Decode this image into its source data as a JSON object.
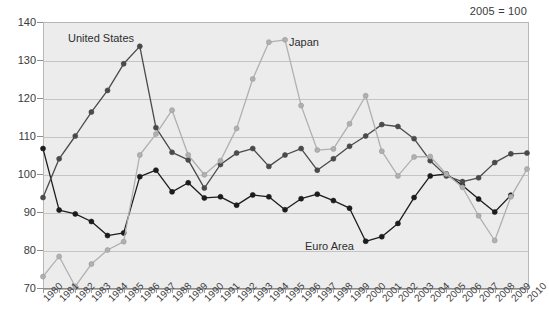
{
  "header": {
    "note": "2005 = 100"
  },
  "annotations": [
    {
      "name": "series-label-united-states",
      "text": "United States",
      "x": 68,
      "y": 32
    },
    {
      "name": "series-label-japan",
      "text": "Japan",
      "x": 289,
      "y": 36
    },
    {
      "name": "series-label-euro-area",
      "text": "Euro Area",
      "x": 305,
      "y": 240
    }
  ],
  "chart_data": {
    "type": "line",
    "title": "",
    "subtitle": "2005 = 100",
    "xlabel": "",
    "ylabel": "",
    "xlim": [
      1980,
      2010
    ],
    "ylim": [
      70,
      140
    ],
    "yticks": [
      70,
      80,
      90,
      100,
      110,
      120,
      130,
      140
    ],
    "grid": true,
    "legend_position": "inline-annotations",
    "x": [
      1980,
      1981,
      1982,
      1983,
      1984,
      1985,
      1986,
      1987,
      1988,
      1989,
      1990,
      1991,
      1992,
      1993,
      1994,
      1995,
      1996,
      1997,
      1998,
      1999,
      2000,
      2001,
      2002,
      2003,
      2004,
      2005,
      2006,
      2007,
      2008,
      2009,
      2010
    ],
    "categories": [
      "1980",
      "1981",
      "1982",
      "1983",
      "1984",
      "1985",
      "1986",
      "1987",
      "1988",
      "1989",
      "1990",
      "1991",
      "1992",
      "1993",
      "1994",
      "1995",
      "1996",
      "1997",
      "1998",
      "1999",
      "2000",
      "2001",
      "2002",
      "2003",
      "2004",
      "2005",
      "2006",
      "2007",
      "2008",
      "2009",
      "2010"
    ],
    "series": [
      {
        "name": "United States",
        "color": "#1c1c1c",
        "marker": "circle",
        "values": [
          106.7,
          90.5,
          89.5,
          87.5,
          83.8,
          84.5,
          99.3,
          101.0,
          95.3,
          97.7,
          93.7,
          94.0,
          91.8,
          94.5,
          94.0,
          90.6,
          93.5,
          94.7,
          93.0,
          91.0,
          82.3,
          83.5,
          87.0,
          93.8,
          99.5,
          100.0,
          97.0,
          93.4,
          90.0,
          94.4,
          null
        ]
      },
      {
        "name": "Euro Area",
        "color": "#4a4a4a",
        "marker": "circle",
        "values": [
          93.8,
          104.0,
          110.0,
          116.3,
          122.0,
          129.0,
          133.6,
          112.2,
          105.7,
          103.7,
          96.3,
          102.5,
          105.5,
          106.7,
          102.0,
          105.0,
          106.7,
          101.0,
          104.0,
          107.3,
          110.0,
          113.0,
          112.5,
          109.3,
          103.5,
          99.5,
          98.0,
          99.0,
          103.0,
          105.3,
          105.5
        ]
      },
      {
        "name": "Japan",
        "color": "#b0b0b0",
        "marker": "circle",
        "values": [
          73.0,
          78.3,
          70.4,
          76.3,
          80.0,
          82.2,
          105.0,
          110.5,
          116.8,
          105.0,
          99.8,
          103.5,
          112.0,
          125.0,
          134.7,
          135.3,
          118.0,
          106.3,
          106.6,
          113.2,
          120.6,
          106.0,
          99.5,
          104.5,
          104.6,
          100.0,
          96.5,
          89.0,
          82.5,
          94.0,
          101.3
        ]
      }
    ]
  }
}
